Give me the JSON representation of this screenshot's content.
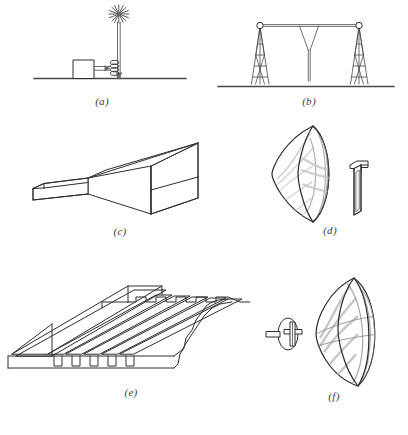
{
  "figure": {
    "background_color": "#ffffff",
    "line_color": "#2e2e2e",
    "shade_color": "#b9b9b9",
    "width": 408,
    "height": 435
  },
  "panels": [
    {
      "id": "a",
      "caption": "(a)",
      "name": "spark-gap-monopole-antenna",
      "description": "Vertical mast antenna on ground plane with starburst spark at the top, feed box and coil at the base",
      "elements": [
        {
          "name": "starburst-spark-icon",
          "label": "spark"
        },
        {
          "name": "vertical-mast",
          "label": "mast"
        },
        {
          "name": "coil-inductor",
          "label": "coil"
        },
        {
          "name": "transmitter-box",
          "label": "box"
        },
        {
          "name": "ground-line",
          "label": "ground"
        }
      ]
    },
    {
      "id": "b",
      "caption": "(b)",
      "name": "tower-supported-wire-antenna",
      "description": "Two tapered lattice masts supporting a horizontal top wire with a central V shaped downlead",
      "elements": [
        {
          "name": "left-lattice-tower",
          "label": "left tower"
        },
        {
          "name": "right-lattice-tower",
          "label": "right tower"
        },
        {
          "name": "horizontal-span-wire",
          "label": "span wire"
        },
        {
          "name": "v-downlead",
          "label": "downlead"
        },
        {
          "name": "ground-line",
          "label": "ground"
        }
      ]
    },
    {
      "id": "c",
      "caption": "(c)",
      "name": "pyramidal-horn-antenna",
      "description": "Rectangular waveguide flaring into a pyramidal horn aperture drawn in perspective",
      "elements": [
        {
          "name": "waveguide-section",
          "label": "waveguide"
        },
        {
          "name": "horn-flare",
          "label": "flare"
        },
        {
          "name": "horn-aperture",
          "label": "aperture"
        }
      ]
    },
    {
      "id": "d",
      "caption": "(d)",
      "name": "parabolic-dish-with-horn-feed",
      "description": "Parabolic reflector dish shown edge on beside a bent rectangular waveguide horn feed",
      "elements": [
        {
          "name": "parabolic-reflector",
          "label": "dish"
        },
        {
          "name": "dish-rim",
          "label": "rim"
        },
        {
          "name": "bent-waveguide-feed",
          "label": "feed"
        }
      ]
    },
    {
      "id": "e",
      "caption": "(e)",
      "name": "corrugated-surface-wave-antenna",
      "description": "Long corrugated slotted plate antenna in perspective with stepped transverse fins",
      "elements": [
        {
          "name": "corrugated-plate",
          "label": "plate"
        },
        {
          "name": "transverse-fins",
          "label": "fins"
        },
        {
          "name": "base-slots",
          "label": "slots"
        },
        {
          "name": "end-wall",
          "label": "end wall"
        }
      ]
    },
    {
      "id": "f",
      "caption": "(f)",
      "name": "parabolic-dish-with-dipole-feed",
      "description": "Parabolic reflector dish beside a dipole feed element mounted on a small circular disk reflector",
      "elements": [
        {
          "name": "parabolic-reflector",
          "label": "dish"
        },
        {
          "name": "dipole-feed",
          "label": "dipole"
        },
        {
          "name": "disk-reflector",
          "label": "disk"
        }
      ]
    }
  ]
}
